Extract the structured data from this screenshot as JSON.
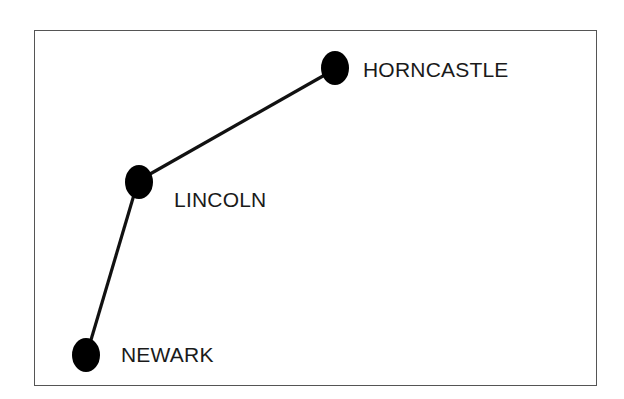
{
  "diagram": {
    "type": "route-map",
    "nodes": [
      {
        "id": "horncastle",
        "label": "HORNCASTLE",
        "x": 335,
        "y": 68,
        "label_x": 363,
        "label_y": 59
      },
      {
        "id": "lincoln",
        "label": "LINCOLN",
        "x": 139,
        "y": 182,
        "label_x": 174,
        "label_y": 189
      },
      {
        "id": "newark",
        "label": "NEWARK",
        "x": 86,
        "y": 355,
        "label_x": 121,
        "label_y": 344
      }
    ],
    "edges": [
      {
        "from": "newark",
        "to": "lincoln"
      },
      {
        "from": "lincoln",
        "to": "horncastle"
      }
    ],
    "colors": {
      "line": "#111111",
      "node": "#000000",
      "border": "#555555"
    }
  }
}
